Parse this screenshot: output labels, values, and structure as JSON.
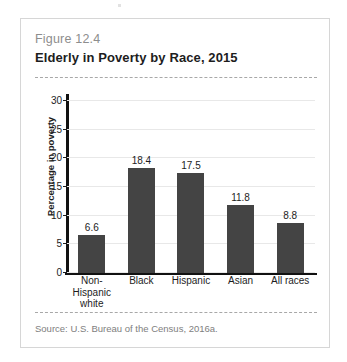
{
  "figure": {
    "number": "Figure 12.4",
    "title": "Elderly in Poverty by Race, 2015",
    "source": "Source: U.S. Bureau of the Census, 2016a."
  },
  "colors": {
    "bar": "#444444",
    "axis": "#111111",
    "grid": "#e8e8e8",
    "fig_number_text": "#8d8d8d",
    "source_text": "#7e7e7e",
    "card_border": "#d6d6d6",
    "dashed_rule": "#a8a8a8"
  },
  "chart_data": {
    "type": "bar",
    "title": "Elderly in Poverty by Race, 2015",
    "categories": [
      "Non-Hispanic white",
      "Black",
      "Hispanic",
      "Asian",
      "All races"
    ],
    "category_lines": [
      [
        "Non-Hispanic",
        "white"
      ],
      [
        "Black"
      ],
      [
        "Hispanic"
      ],
      [
        "Asian"
      ],
      [
        "All races"
      ]
    ],
    "values": [
      6.6,
      18.4,
      17.5,
      11.8,
      8.8
    ],
    "value_labels": [
      "6.6",
      "18.4",
      "17.5",
      "11.8",
      "8.8"
    ],
    "xlabel": "",
    "ylabel": "Percentage in poverty",
    "ylim": [
      0,
      30
    ],
    "yticks": [
      0,
      5,
      10,
      15,
      20,
      25,
      30
    ],
    "ytick_labels": [
      "0",
      "5",
      "10",
      "15",
      "20",
      "25",
      "30"
    ],
    "grid": true,
    "grid_axis": "y",
    "legend": false,
    "legend_position": "none"
  }
}
